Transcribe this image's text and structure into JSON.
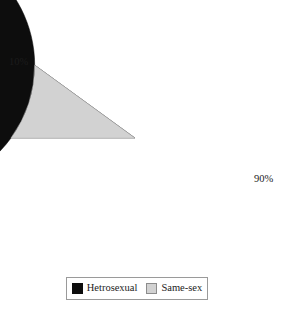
{
  "chart_data": {
    "type": "pie",
    "title": "",
    "subtitle": "",
    "xlabel": "",
    "ylabel": "",
    "categories": [
      "Hetrosexual",
      "Same-sex"
    ],
    "values": [
      90,
      10
    ],
    "value_unit": "%",
    "data_labels": [
      "90%",
      "10%"
    ],
    "colors": [
      "#0d0d0d",
      "#d2d2d2"
    ],
    "legend_position": "bottom",
    "legend_border": true,
    "grid": false,
    "start_angle_deg": 180,
    "direction": "clockwise",
    "slices": [
      {
        "name": "Hetrosexual",
        "value": 90,
        "label": "90%",
        "color": "#0d0d0d",
        "sweep_deg": 324
      },
      {
        "name": "Same-sex",
        "value": 10,
        "label": "10%",
        "color": "#d2d2d2",
        "sweep_deg": 36
      }
    ]
  },
  "labels": {
    "small_slice_pct": "10%",
    "large_slice_pct": "90%"
  },
  "legend": {
    "items": [
      {
        "label": "Hetrosexual",
        "color": "#0d0d0d"
      },
      {
        "label": "Same-sex",
        "color": "#d2d2d2"
      }
    ]
  }
}
